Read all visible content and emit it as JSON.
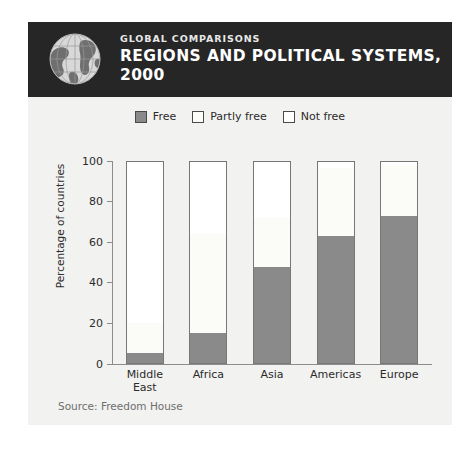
{
  "card": {
    "background_color": "#f2f2f0"
  },
  "header": {
    "kicker": "GLOBAL COMPARISONS",
    "title_line1": "REGIONS AND POLITICAL SYSTEMS,",
    "title_line2": "2000",
    "background_color": "#262626",
    "icon": "globe-icon"
  },
  "source": {
    "text": "Source: Freedom House"
  },
  "chart_data": {
    "type": "bar",
    "subtype": "stacked-column-100",
    "title": "Regions and Political Systems, 2000",
    "xlabel": "",
    "ylabel": "Percentage of countries",
    "ylim": [
      0,
      100
    ],
    "yticks": [
      0,
      20,
      40,
      60,
      80,
      100
    ],
    "ytick_labels": [
      "0",
      "20",
      "40",
      "60",
      "80",
      "100"
    ],
    "grid": false,
    "legend_position": "top-center",
    "categories": [
      "Middle East",
      "Africa",
      "Asia",
      "Americas",
      "Europe"
    ],
    "category_lines": [
      [
        "Middle",
        "East"
      ],
      [
        "Africa"
      ],
      [
        "Asia"
      ],
      [
        "Americas"
      ],
      [
        "Europe"
      ]
    ],
    "series": [
      {
        "name": "Free",
        "color": "#8a8a8a",
        "values": [
          5,
          15,
          48,
          63,
          73
        ]
      },
      {
        "name": "Partly free",
        "color": "#fbfbf7",
        "values": [
          15,
          49,
          24,
          34,
          25
        ]
      },
      {
        "name": "Not free",
        "color": "#ffffff",
        "values": [
          80,
          36,
          28,
          3,
          2
        ]
      }
    ],
    "cumulative_tops": {
      "Free": [
        5,
        15,
        48,
        63,
        73
      ],
      "Partly free": [
        20,
        64,
        72,
        97,
        98
      ],
      "Not free": [
        100,
        100,
        100,
        100,
        100
      ]
    },
    "axis_color": "#8c8c8c",
    "bar_outline_color": "#777777"
  }
}
